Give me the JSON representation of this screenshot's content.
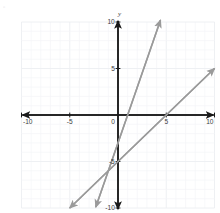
{
  "figure": {
    "kind": "cartesian-graph",
    "axis_label_y": "y",
    "axis_label_x": "",
    "background_color": "#ffffff",
    "grid_color": "#eceef2",
    "grid_minor_color": "#f4f5f8",
    "axis_color": "#1a1a1a",
    "line_color": "#9a9a9a",
    "tick_label_color": "#3c3c3c"
  },
  "corner_artifact": {
    "glyph": "▫"
  },
  "chart_data": {
    "type": "line",
    "title": "",
    "xlabel": "",
    "ylabel": "y",
    "xlim": [
      -10,
      10
    ],
    "ylim": [
      -10,
      10
    ],
    "grid": true,
    "grid_step": 1,
    "tick_step": 5,
    "xticks": [
      -10,
      -5,
      0,
      5,
      10
    ],
    "xtick_labels": [
      "-10",
      "-5",
      "0",
      "5",
      "10"
    ],
    "yticks": [
      -10,
      -5,
      5,
      10
    ],
    "ytick_labels": [
      "-10",
      "-5",
      "5",
      "10"
    ],
    "legend": "none",
    "series": [
      {
        "name": "line-1",
        "slope": 3,
        "intercept": -3,
        "style": "solid",
        "arrows": "both",
        "x": [
          -2.3,
          4.4
        ],
        "y": [
          -9.9,
          10.2
        ]
      },
      {
        "name": "line-2",
        "slope": 1,
        "intercept": -5,
        "style": "solid",
        "arrows": "both",
        "x": [
          -5.0,
          10.0
        ],
        "y": [
          -10.0,
          5.0
        ]
      }
    ]
  }
}
